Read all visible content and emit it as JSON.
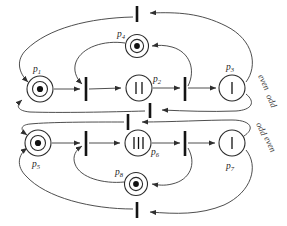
{
  "figure": {
    "type": "petri-net-diagram",
    "title": "",
    "background": "#ffffff",
    "line_color": "#3a3a3a",
    "ink_color": "#141414"
  },
  "places": [
    {
      "id": "p1",
      "label": "p",
      "sub": "1",
      "cx": 40,
      "cy": 90,
      "r": 13,
      "marking_kind": "dot",
      "marking_count": 1,
      "marking_glyph": "●",
      "label_x": 35,
      "label_y": 70
    },
    {
      "id": "p2",
      "label": "p",
      "sub": "2",
      "cx": 139,
      "cy": 87,
      "r": 13,
      "marking_kind": "bars",
      "marking_count": 2,
      "marking_glyph": "II",
      "label_x": 153,
      "label_y": 80
    },
    {
      "id": "p3",
      "label": "p",
      "sub": "3",
      "cx": 233,
      "cy": 88,
      "r": 13,
      "marking_kind": "bars",
      "marking_count": 1,
      "marking_glyph": "I",
      "label_x": 228,
      "label_y": 68
    },
    {
      "id": "p4",
      "label": "p",
      "sub": "4",
      "cx": 137,
      "cy": 46,
      "r": 11,
      "marking_kind": "dot",
      "marking_count": 1,
      "marking_glyph": "●",
      "label_x": 120,
      "label_y": 35
    },
    {
      "id": "p5",
      "label": "p",
      "sub": "5",
      "cx": 38,
      "cy": 143,
      "r": 13,
      "marking_kind": "dot",
      "marking_count": 1,
      "marking_glyph": "●",
      "label_x": 34,
      "label_y": 166
    },
    {
      "id": "p6",
      "label": "p",
      "sub": "6",
      "cx": 138,
      "cy": 143,
      "r": 13,
      "marking_kind": "bars",
      "marking_count": 3,
      "marking_glyph": "III",
      "label_x": 152,
      "label_y": 154
    },
    {
      "id": "p7",
      "label": "p",
      "sub": "7",
      "cx": 232,
      "cy": 143,
      "r": 13,
      "marking_kind": "bars",
      "marking_count": 1,
      "marking_glyph": "I",
      "label_x": 227,
      "label_y": 167
    },
    {
      "id": "p8",
      "label": "p",
      "sub": "8",
      "cx": 136,
      "cy": 184,
      "r": 11,
      "marking_kind": "dot",
      "marking_count": 1,
      "marking_glyph": "●",
      "label_x": 118,
      "label_y": 174
    }
  ],
  "transitions": [
    {
      "id": "t-top",
      "x": 137,
      "y": 14,
      "height": 15
    },
    {
      "id": "t-upper-left",
      "x": 86,
      "y": 88,
      "height": 20
    },
    {
      "id": "t-upper-right",
      "x": 185,
      "y": 88,
      "height": 20
    },
    {
      "id": "t-mid-upper",
      "x": 148,
      "y": 108,
      "height": 14
    },
    {
      "id": "t-mid-lower",
      "x": 127,
      "y": 120,
      "height": 14
    },
    {
      "id": "t-lower-left",
      "x": 86,
      "y": 143,
      "height": 20
    },
    {
      "id": "t-lower-right",
      "x": 185,
      "y": 143,
      "height": 20
    },
    {
      "id": "t-bottom",
      "x": 137,
      "y": 209,
      "height": 15
    }
  ],
  "side_labels": [
    {
      "id": "even-upper",
      "text": "even",
      "x": 264,
      "y": 80,
      "rotate": 65
    },
    {
      "id": "odd-upper",
      "text": "odd",
      "x": 272,
      "y": 100,
      "rotate": 65
    },
    {
      "id": "odd-lower",
      "text": "odd",
      "x": 262,
      "y": 128,
      "rotate": 65
    },
    {
      "id": "even-lower",
      "text": "even",
      "x": 270,
      "y": 143,
      "rotate": 65
    }
  ],
  "arcs": [
    {
      "id": "arc-p1-to-t-upper-left",
      "from": "p1",
      "to": "t-upper-left",
      "kind": "straight"
    },
    {
      "id": "arc-t-upper-left-to-p2",
      "from": "t-upper-left",
      "to": "p2",
      "kind": "straight"
    },
    {
      "id": "arc-p2-to-t-upper-right",
      "from": "p2",
      "to": "t-upper-right",
      "kind": "straight"
    },
    {
      "id": "arc-t-upper-right-to-p3",
      "from": "t-upper-right",
      "to": "p3",
      "kind": "straight"
    },
    {
      "id": "arc-p4-to-t-upper-left",
      "from": "p4",
      "to": "t-upper-left",
      "kind": "curve"
    },
    {
      "id": "arc-t-upper-right-to-p4",
      "from": "t-upper-right",
      "to": "p4",
      "kind": "curve"
    },
    {
      "id": "arc-t-top-to-p1",
      "from": "t-top",
      "to": "p1",
      "kind": "curve"
    },
    {
      "id": "arc-p3-to-t-top",
      "from": "p3",
      "to": "t-top",
      "kind": "curve"
    },
    {
      "id": "arc-t-mid-upper-to-p1",
      "from": "t-mid-upper",
      "to": "p1",
      "kind": "curve"
    },
    {
      "id": "arc-p3-to-t-mid-upper",
      "from": "p3",
      "to": "t-mid-upper",
      "kind": "curve"
    },
    {
      "id": "arc-p5-to-t-lower-left",
      "from": "p5",
      "to": "t-lower-left",
      "kind": "straight"
    },
    {
      "id": "arc-t-lower-left-to-p6",
      "from": "t-lower-left",
      "to": "p6",
      "kind": "straight"
    },
    {
      "id": "arc-p6-to-t-lower-right",
      "from": "p6",
      "to": "t-lower-right",
      "kind": "straight"
    },
    {
      "id": "arc-t-lower-right-to-p7",
      "from": "t-lower-right",
      "to": "p7",
      "kind": "straight"
    },
    {
      "id": "arc-p8-to-t-lower-left",
      "from": "p8",
      "to": "t-lower-left",
      "kind": "curve"
    },
    {
      "id": "arc-t-lower-right-to-p8",
      "from": "t-lower-right",
      "to": "p8",
      "kind": "curve"
    },
    {
      "id": "arc-t-mid-lower-to-p5",
      "from": "t-mid-lower",
      "to": "p5",
      "kind": "curve"
    },
    {
      "id": "arc-p7-to-t-mid-lower",
      "from": "p7",
      "to": "t-mid-lower",
      "kind": "curve"
    },
    {
      "id": "arc-t-bottom-to-p5",
      "from": "t-bottom",
      "to": "p5",
      "kind": "curve"
    },
    {
      "id": "arc-p7-to-t-bottom",
      "from": "p7",
      "to": "t-bottom",
      "kind": "curve"
    }
  ]
}
